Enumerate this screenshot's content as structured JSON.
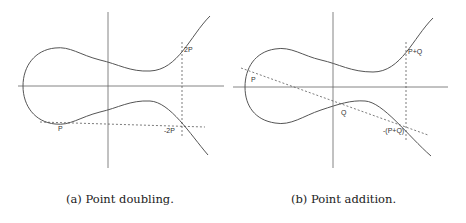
{
  "figures": [
    {
      "id": "a",
      "caption": "(a) Point doubling.",
      "labels": {
        "p": "P",
        "two_p": "2P",
        "neg_two_p": "-2P"
      }
    },
    {
      "id": "b",
      "caption": "(b) Point addition.",
      "labels": {
        "p": "P",
        "q": "Q",
        "p_plus_q": "P+Q",
        "neg_p_plus_q": "-(P+Q)"
      }
    }
  ],
  "colors": {
    "curve": "#555555",
    "axis": "#666666",
    "dashed": "#444444",
    "text": "#222222"
  }
}
